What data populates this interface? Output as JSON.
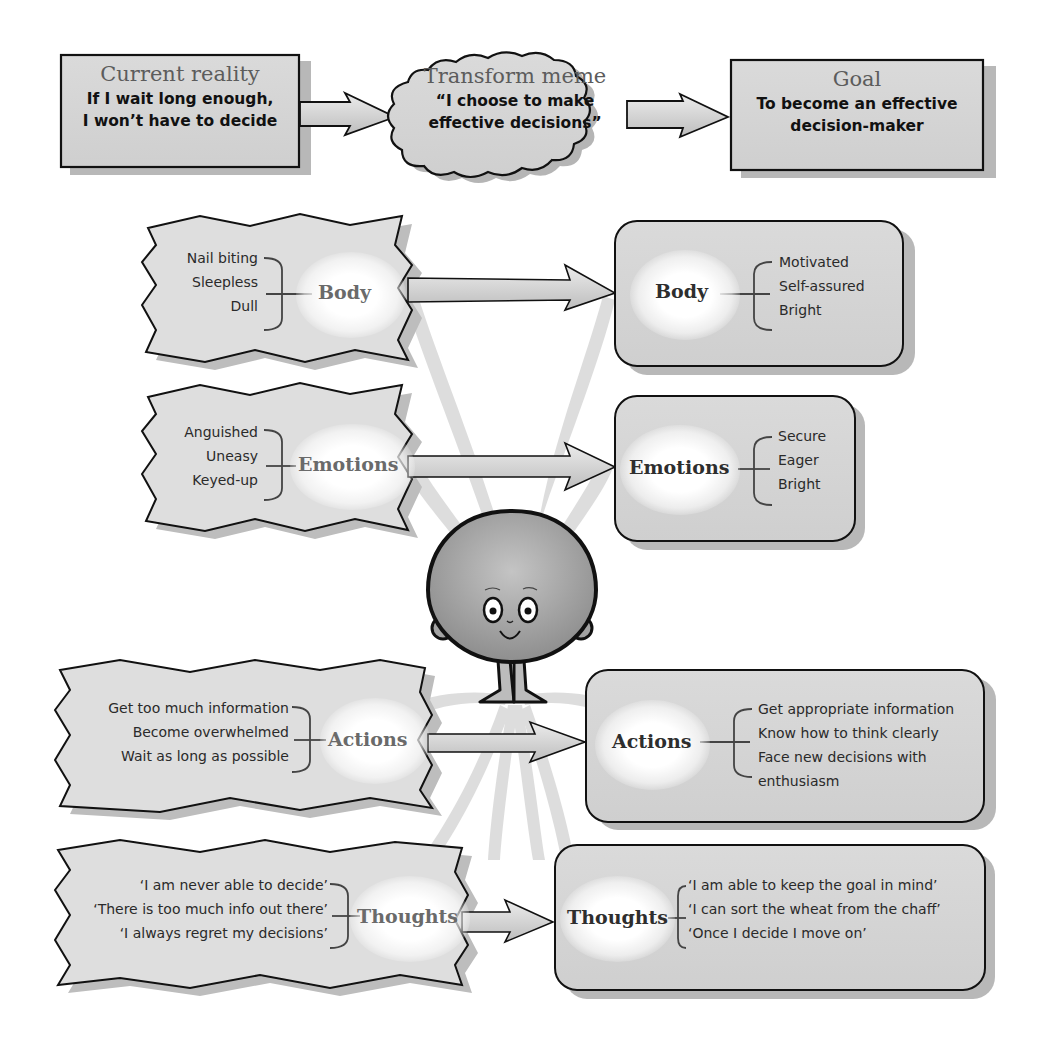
{
  "top_row": {
    "current_reality": {
      "heading": "Current reality",
      "text_line1": "If I wait long enough,",
      "text_line2": "I won’t have to decide"
    },
    "transform_meme": {
      "heading": "Transform meme",
      "text_line1": "“I choose to make",
      "text_line2": "effective decisions”"
    },
    "goal": {
      "heading": "Goal",
      "text_line1": "To become an effective",
      "text_line2": "decision-maker"
    }
  },
  "categories": [
    {
      "name": "Body",
      "current": [
        "Nail biting",
        "Sleepless",
        "Dull"
      ],
      "desired": [
        "Motivated",
        "Self-assured",
        "Bright"
      ]
    },
    {
      "name": "Emotions",
      "current": [
        "Anguished",
        "Uneasy",
        "Keyed-up"
      ],
      "desired": [
        "Secure",
        "Eager",
        "Bright"
      ]
    },
    {
      "name": "Actions",
      "current": [
        "Get too much information",
        "Become overwhelmed",
        "Wait as long as possible"
      ],
      "desired": [
        "Get appropriate information",
        "Know how to think clearly",
        "Face new decisions with",
        "enthusiasm"
      ]
    },
    {
      "name": "Thoughts",
      "current": [
        "‘I am never able to decide’",
        "‘There is too much info out there’",
        "‘I always regret my decisions’"
      ],
      "desired": [
        "‘I am able to keep the goal in mind’",
        "‘I can sort the wheat from the chaff’",
        "‘Once I decide I move on’"
      ]
    }
  ],
  "character": {
    "icon": "smiling-round-head-character-icon"
  },
  "colors": {
    "box_fill": "#d6d6d6",
    "box_fill_light": "#e2e2e2",
    "outline": "#111111",
    "shadow": "#b5b5b5",
    "rays": "#d8d8d8",
    "heading_gray": "#5c5c5c"
  }
}
